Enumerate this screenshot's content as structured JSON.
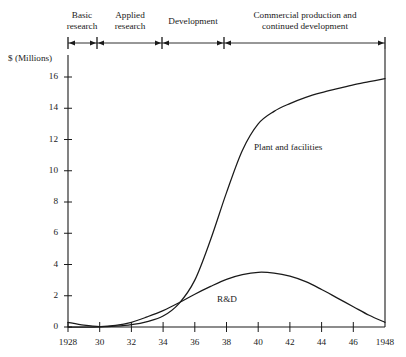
{
  "chart_data": {
    "type": "line",
    "title": "",
    "xlabel": "",
    "ylabel": "$ (Millions)",
    "xlim": [
      1928,
      1948
    ],
    "ylim": [
      0,
      16
    ],
    "grid": false,
    "legend_position": "inline-annotations",
    "x_ticks": [
      "1928",
      "30",
      "32",
      "34",
      "36",
      "38",
      "40",
      "42",
      "44",
      "46",
      "1948"
    ],
    "x_tick_values": [
      1928,
      1930,
      1932,
      1934,
      1936,
      1938,
      1940,
      1942,
      1944,
      1946,
      1948
    ],
    "y_ticks": [
      "0",
      "2",
      "4",
      "6",
      "8",
      "10",
      "12",
      "14",
      "16"
    ],
    "y_tick_values": [
      0,
      2,
      4,
      6,
      8,
      10,
      12,
      14,
      16
    ],
    "x": [
      1928,
      1929,
      1930,
      1931,
      1932,
      1933,
      1934,
      1935,
      1936,
      1937,
      1938,
      1939,
      1940,
      1941,
      1942,
      1943,
      1944,
      1945,
      1946,
      1947,
      1948
    ],
    "series": [
      {
        "name": "Plant and facilities",
        "label": "Plant and facilities",
        "color": "#1a1a1a",
        "values": [
          0.0,
          0.0,
          0.0,
          0.05,
          0.15,
          0.35,
          0.7,
          1.5,
          3.0,
          5.6,
          8.6,
          11.3,
          13.0,
          13.8,
          14.3,
          14.7,
          15.0,
          15.25,
          15.5,
          15.7,
          15.9
        ]
      },
      {
        "name": "R&D",
        "label": "R&D",
        "color": "#1a1a1a",
        "values": [
          0.3,
          0.12,
          0.03,
          0.1,
          0.3,
          0.65,
          1.05,
          1.55,
          2.1,
          2.6,
          3.05,
          3.35,
          3.5,
          3.45,
          3.25,
          2.9,
          2.4,
          1.85,
          1.3,
          0.75,
          0.3
        ]
      }
    ],
    "annotations": [
      {
        "name": "plant-and-facilities-label",
        "text": "Plant and facilities",
        "x_px": 254,
        "y_px": 142
      },
      {
        "name": "rd-label",
        "text": "R&D",
        "x_px": 217,
        "y_px": 294
      }
    ]
  },
  "phase_axis": {
    "name": "development-phase-timeline",
    "start_px": 68,
    "end_px": 385,
    "dividers_px": [
      97,
      162,
      224
    ],
    "phases": [
      {
        "label": "Basic\nresearch",
        "center_px": 82,
        "top_px": 10
      },
      {
        "label": "Applied\nresearch",
        "center_px": 130,
        "top_px": 10
      },
      {
        "label": "Development",
        "center_px": 193,
        "top_px": 16
      },
      {
        "label": "Commercial production and\ncontinued development",
        "center_px": 305,
        "top_px": 10
      }
    ]
  },
  "axes": {
    "y_axis_title": "$ (Millions)",
    "y_axis_title_x_px": 8,
    "y_axis_title_y_px": 53
  }
}
